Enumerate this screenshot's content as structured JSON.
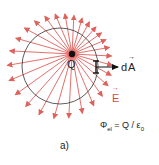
{
  "chart_data": {
    "type": "diagram",
    "charge": {
      "label": "Q",
      "cx": 72,
      "cy": 54,
      "color": "#111111",
      "glow_color": "#e85a5a"
    },
    "surface": {
      "shape": "circle",
      "cx": 60,
      "cy": 66,
      "r": 38,
      "stroke": "#333333"
    },
    "field_lines": {
      "count": 28,
      "color": "#e0605a",
      "extend_beyond_surface": 15,
      "label": "E"
    },
    "area_element": {
      "label": "dA",
      "x": 96,
      "y1": 61,
      "y2": 73,
      "arrow_to_x": 118,
      "arrow_y": 67,
      "color": "#111111"
    },
    "formula": {
      "lhs": "Φ",
      "lhs_sub": "el",
      "rhs": "= Q / ε",
      "rhs_sub": "0"
    },
    "caption": "a)"
  },
  "labels": {
    "q": "Q",
    "d": "d",
    "a": "A",
    "e": "E",
    "phi": "Φ",
    "phi_sub": "el",
    "eq": " = Q / ε",
    "eps_sub": "0",
    "caption": "a)"
  }
}
